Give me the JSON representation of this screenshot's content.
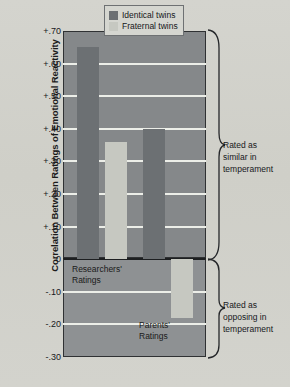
{
  "chart_data": {
    "type": "bar",
    "title": "",
    "xlabel": "",
    "ylabel": "Correlation Between Ratings of Emotional Reactivity",
    "ylim": [
      -0.3,
      0.7
    ],
    "grid": true,
    "legend_position": "top-right",
    "categories": [
      "Researchers' Ratings",
      "Parents' Ratings"
    ],
    "series": [
      {
        "name": "Identical twins",
        "color": "#6c7073",
        "values": [
          0.65,
          0.4
        ]
      },
      {
        "name": "Fraternal twins",
        "color": "#c6c8c1",
        "values": [
          0.36,
          -0.18
        ]
      }
    ],
    "ytick_labels": [
      "+.70",
      "+.60",
      "+.50",
      "+.40",
      "+.30",
      "+.20",
      "+.10",
      "0",
      "-.10",
      "-.20",
      "-.30"
    ],
    "ytick_values": [
      0.7,
      0.6,
      0.5,
      0.4,
      0.3,
      0.2,
      0.1,
      0,
      -0.1,
      -0.2,
      -0.3
    ],
    "annotations": [
      {
        "text": "Rated as\nsimilar in\ntemperament",
        "region": "positive"
      },
      {
        "text": "Rated as\nopposing in\ntemperament",
        "region": "negative"
      }
    ],
    "group_labels": [
      {
        "text": "Researchers'\nRatings"
      },
      {
        "text": "Parents'\nRatings"
      }
    ]
  },
  "legend": {
    "items": [
      {
        "label": "Identical twins",
        "color": "#6c7073"
      },
      {
        "label": "Fraternal twins",
        "color": "#c6c8c1"
      }
    ]
  },
  "axis": {
    "y_title": "Correlation Between Ratings of Emotional Reactivity"
  },
  "colors": {
    "plot_positive_bg": "#85888a",
    "plot_negative_bg": "#8e9193",
    "gridline": "#eceee8",
    "bar_identical": "#6c7073",
    "bar_fraternal": "#c6c8c1",
    "page_bg": "#d2d2cc",
    "axis_line": "#1d1f21"
  }
}
